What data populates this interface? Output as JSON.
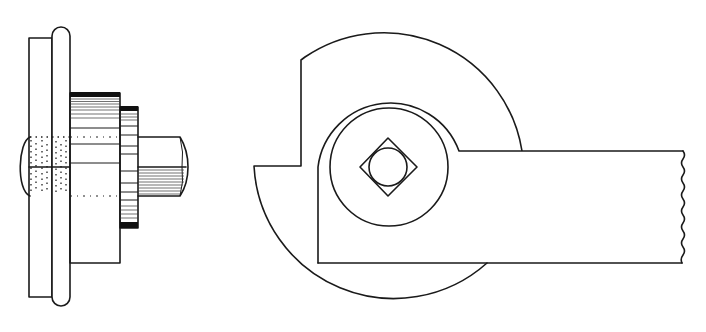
{
  "figure": {
    "type": "mechanical-drawing",
    "background": "#ffffff",
    "ink": "#1a1a1a",
    "views": [
      {
        "name": "side-elevation",
        "parts": [
          "back-plate",
          "rounded-flange",
          "bolt-head",
          "washer-body",
          "knurled-nut",
          "bolt-end"
        ]
      },
      {
        "name": "front-elevation",
        "parts": [
          "outer-disc",
          "boss-ring",
          "inner-circle",
          "square-bolt-head",
          "lever-arm-with-break-line"
        ]
      }
    ]
  }
}
